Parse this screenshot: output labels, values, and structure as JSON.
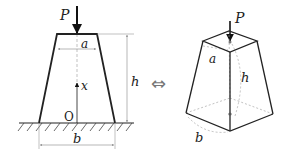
{
  "diagram": {
    "left_figure": {
      "load_label": "P",
      "top_width_label": "a",
      "height_label": "h",
      "axis_label": "x",
      "origin_label": "O",
      "base_width_label": "b"
    },
    "equivalence_symbol": "⇔",
    "right_figure": {
      "load_label": "P",
      "top_width_label": "a",
      "height_label": "h",
      "base_width_label": "b"
    },
    "colors": {
      "stroke": "#222222",
      "dimension": "#888888",
      "dashed": "#999999"
    }
  }
}
